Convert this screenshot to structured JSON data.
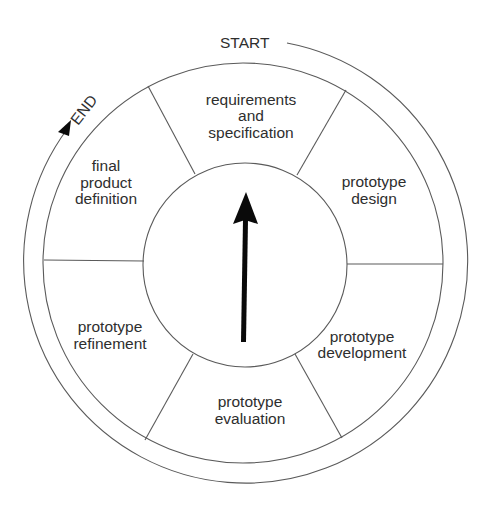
{
  "diagram": {
    "type": "cycle",
    "title": "",
    "start_label": "START",
    "end_label": "END",
    "segments": [
      {
        "id": "requirements",
        "lines": [
          "requirements",
          "and",
          "specification"
        ]
      },
      {
        "id": "design",
        "lines": [
          "prototype",
          "design"
        ]
      },
      {
        "id": "development",
        "lines": [
          "prototype",
          "development"
        ]
      },
      {
        "id": "evaluation",
        "lines": [
          "prototype",
          "evaluation"
        ]
      },
      {
        "id": "refinement",
        "lines": [
          "prototype",
          "refinement"
        ]
      },
      {
        "id": "final",
        "lines": [
          "final",
          "product",
          "definition"
        ]
      }
    ],
    "center_icon": "up-arrow-icon",
    "colors": {
      "line": "#5a5a5a",
      "text": "#2e2e2e",
      "arrow": "#0a0a0a",
      "background": "#ffffff"
    }
  }
}
